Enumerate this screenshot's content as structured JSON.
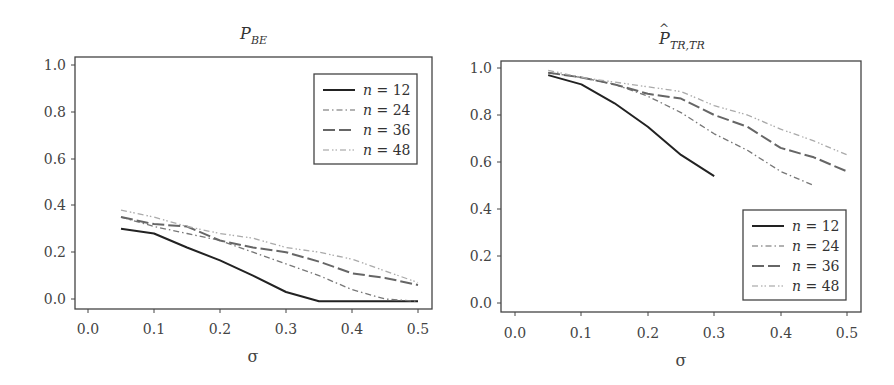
{
  "chart_data": [
    {
      "type": "line",
      "title": "P_BE",
      "title_main": "P",
      "title_sub": "BE",
      "title_hat": false,
      "xlabel": "σ",
      "ylabel": "",
      "xlim": [
        -0.02,
        0.51
      ],
      "ylim": [
        -0.04,
        1.03
      ],
      "xticks": [
        0.0,
        0.1,
        0.2,
        0.3,
        0.4,
        0.5
      ],
      "xtick_labels": [
        "0.0",
        "0.1",
        "0.2",
        "0.3",
        "0.4",
        "0.5"
      ],
      "yticks": [
        0.0,
        0.2,
        0.4,
        0.6,
        0.8,
        1.0
      ],
      "ytick_labels": [
        "0.0",
        "0.2",
        "0.4",
        "0.6",
        "0.8",
        "1.0"
      ],
      "grid": false,
      "legend_position": "upper right",
      "series": [
        {
          "name": "n = 12",
          "n_label": "n",
          "n_value": "= 12",
          "style": "solid",
          "color": "#222222",
          "x": [
            0.05,
            0.1,
            0.15,
            0.2,
            0.25,
            0.3,
            0.35,
            0.4,
            0.45,
            0.5
          ],
          "values": [
            0.3,
            0.28,
            0.22,
            0.165,
            0.1,
            0.03,
            -0.01,
            -0.01,
            -0.01,
            -0.01
          ]
        },
        {
          "name": "n = 24",
          "n_label": "n",
          "n_value": "= 24",
          "style": "dashdot",
          "color": "#777777",
          "x": [
            0.05,
            0.1,
            0.15,
            0.2,
            0.25,
            0.3,
            0.35,
            0.4,
            0.45,
            0.5
          ],
          "values": [
            0.35,
            0.31,
            0.28,
            0.25,
            0.2,
            0.15,
            0.1,
            0.04,
            0.0,
            -0.01
          ]
        },
        {
          "name": "n = 36",
          "n_label": "n",
          "n_value": "= 36",
          "style": "dashed",
          "color": "#666666",
          "x": [
            0.05,
            0.1,
            0.15,
            0.2,
            0.25,
            0.3,
            0.35,
            0.4,
            0.45,
            0.5
          ],
          "values": [
            0.35,
            0.32,
            0.31,
            0.25,
            0.22,
            0.2,
            0.16,
            0.11,
            0.09,
            0.06
          ]
        },
        {
          "name": "n = 48",
          "n_label": "n",
          "n_value": "= 48",
          "style": "dashdotdot",
          "color": "#aaaaaa",
          "x": [
            0.05,
            0.1,
            0.15,
            0.2,
            0.25,
            0.3,
            0.35,
            0.4,
            0.45,
            0.5
          ],
          "values": [
            0.38,
            0.35,
            0.31,
            0.28,
            0.26,
            0.22,
            0.2,
            0.17,
            0.12,
            0.07
          ]
        }
      ]
    },
    {
      "type": "line",
      "title": "P̂_TR,TR",
      "title_main": "P",
      "title_sub": "TR,TR",
      "title_hat": true,
      "xlabel": "σ",
      "ylabel": "",
      "xlim": [
        -0.02,
        0.52
      ],
      "ylim": [
        -0.04,
        1.04
      ],
      "xticks": [
        0.0,
        0.1,
        0.2,
        0.3,
        0.4,
        0.5
      ],
      "xtick_labels": [
        "0.0",
        "0.1",
        "0.2",
        "0.3",
        "0.4",
        "0.5"
      ],
      "yticks": [
        0.0,
        0.2,
        0.4,
        0.6,
        0.8,
        1.0
      ],
      "ytick_labels": [
        "0.0",
        "0.2",
        "0.4",
        "0.6",
        "0.8",
        "1.0"
      ],
      "grid": false,
      "legend_position": "lower right",
      "series": [
        {
          "name": "n = 12",
          "n_label": "n",
          "n_value": "= 12",
          "style": "solid",
          "color": "#222222",
          "x": [
            0.05,
            0.1,
            0.15,
            0.2,
            0.25,
            0.3
          ],
          "values": [
            0.97,
            0.93,
            0.85,
            0.75,
            0.63,
            0.54
          ]
        },
        {
          "name": "n = 24",
          "n_label": "n",
          "n_value": "= 24",
          "style": "dashdot",
          "color": "#777777",
          "x": [
            0.05,
            0.1,
            0.15,
            0.2,
            0.25,
            0.3,
            0.35,
            0.4,
            0.45
          ],
          "values": [
            0.98,
            0.96,
            0.93,
            0.88,
            0.81,
            0.72,
            0.65,
            0.56,
            0.5
          ]
        },
        {
          "name": "n = 36",
          "n_label": "n",
          "n_value": "= 36",
          "style": "dashed",
          "color": "#666666",
          "x": [
            0.05,
            0.1,
            0.15,
            0.2,
            0.25,
            0.3,
            0.35,
            0.4,
            0.45,
            0.5
          ],
          "values": [
            0.98,
            0.96,
            0.93,
            0.89,
            0.87,
            0.8,
            0.75,
            0.66,
            0.62,
            0.56
          ]
        },
        {
          "name": "n = 48",
          "n_label": "n",
          "n_value": "= 48",
          "style": "dashdotdot",
          "color": "#aaaaaa",
          "x": [
            0.05,
            0.1,
            0.15,
            0.2,
            0.25,
            0.3,
            0.35,
            0.4,
            0.45,
            0.5
          ],
          "values": [
            0.99,
            0.96,
            0.94,
            0.92,
            0.9,
            0.84,
            0.8,
            0.74,
            0.69,
            0.63
          ]
        }
      ]
    }
  ]
}
